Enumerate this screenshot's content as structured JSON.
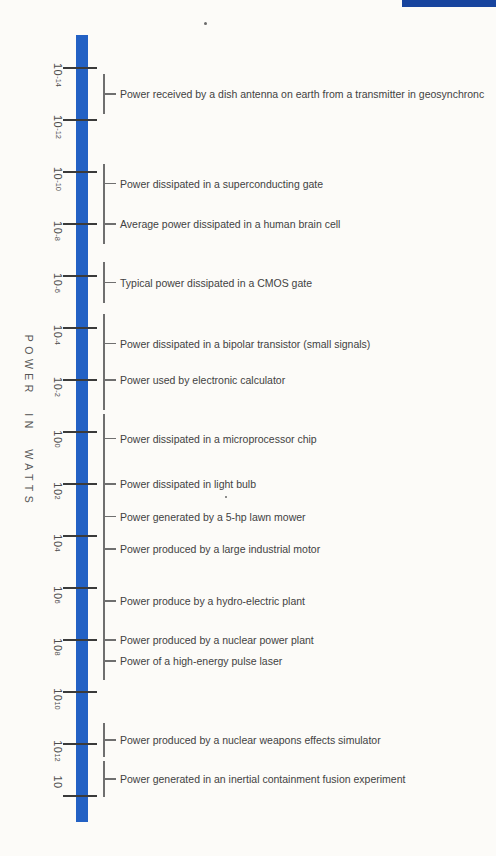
{
  "page": {
    "background_color": "#fcfbf8",
    "corner_bar_color": "#17449e"
  },
  "colors": {
    "scale_bar": "#2361c4",
    "tick": "#3a3a3a",
    "leader_line": "#6f6f6f",
    "text": "#424242"
  },
  "chart_data": {
    "type": "scatter",
    "subtype": "annotated-vertical-log-scale",
    "title": "",
    "ylabel": "POWER IN WATTS",
    "scale": "log10",
    "unit": "watts",
    "axis_exponent_range": [
      -14,
      14
    ],
    "grid": false,
    "ticks": [
      {
        "mantissa": "10",
        "exp_label": "-14",
        "exp_value": -14
      },
      {
        "mantissa": "10",
        "exp_label": "-12",
        "exp_value": -12
      },
      {
        "mantissa": "10",
        "exp_label": "-10",
        "exp_value": -10
      },
      {
        "mantissa": "10",
        "exp_label": "-8",
        "exp_value": -8
      },
      {
        "mantissa": "10",
        "exp_label": "-6",
        "exp_value": -6
      },
      {
        "mantissa": "10",
        "exp_label": "-4",
        "exp_value": -4
      },
      {
        "mantissa": "10",
        "exp_label": "-2",
        "exp_value": -2
      },
      {
        "mantissa": "10",
        "exp_label": "0",
        "exp_value": 0
      },
      {
        "mantissa": "10",
        "exp_label": "2",
        "exp_value": 2
      },
      {
        "mantissa": "10",
        "exp_label": "4",
        "exp_value": 4
      },
      {
        "mantissa": "10",
        "exp_label": "6",
        "exp_value": 6
      },
      {
        "mantissa": "10",
        "exp_label": "8",
        "exp_value": 8
      },
      {
        "mantissa": "10",
        "exp_label": "10",
        "exp_value": 10
      },
      {
        "mantissa": "10",
        "exp_label": "12",
        "exp_value": 12
      },
      {
        "mantissa": "10",
        "exp_label": "",
        "exp_value": 14
      }
    ],
    "annotations": [
      {
        "label": "Power received by a dish antenna on earth from a transmitter in geosynchronc",
        "exp": -13.0,
        "span_decades": 0.77
      },
      {
        "label": "Power dissipated in a superconducting gate",
        "exp": -9.55,
        "span_decades": 0.77
      },
      {
        "label": "Average power dissipated in a human brain cell",
        "exp": -8.0,
        "span_decades": 0.77
      },
      {
        "label": "Typical power dissipated in a CMOS gate",
        "exp": -5.75,
        "span_decades": 0.8
      },
      {
        "label": "Power dissipated in a bipolar transistor (small signals)",
        "exp": -3.4,
        "span_decades": 1.15
      },
      {
        "label": "Power used by electronic calculator",
        "exp": -2.0,
        "span_decades": 1.15
      },
      {
        "label": "Power dissipated in a microprocessor chip",
        "exp": 0.25,
        "span_decades": 0.96
      },
      {
        "label": "Power dissipated in light bulb",
        "exp": 2.0,
        "span_decades": 0.96
      },
      {
        "label": "Power generated by a 5-hp lawn mower",
        "exp": 3.25,
        "span_decades": 0.77
      },
      {
        "label": "Power produced by a large industrial motor",
        "exp": 4.5,
        "span_decades": 0.96
      },
      {
        "label": "Power produce by a hydro-electric plant",
        "exp": 6.5,
        "span_decades": 1.04
      },
      {
        "label": "Power produced by a nuclear power plant",
        "exp": 8.0,
        "span_decades": 0.65
      },
      {
        "label": "Power of a high-energy pulse laser",
        "exp": 8.8,
        "span_decades": 0.73
      },
      {
        "label": "Power produced by a nuclear weapons effects simulator",
        "exp": 11.85,
        "span_decades": 0.65
      },
      {
        "label": "Power generated in an inertial containment fusion experiment",
        "exp": 13.35,
        "span_decades": 0.7
      }
    ]
  }
}
